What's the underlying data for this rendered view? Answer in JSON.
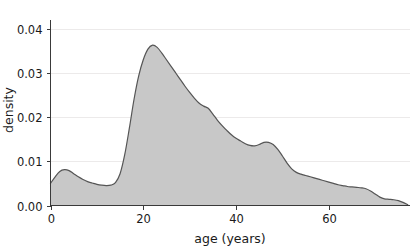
{
  "chart_data": {
    "type": "area",
    "title": "",
    "subtitle": "",
    "xlabel": "age (years)",
    "ylabel": "density",
    "xlim": [
      0,
      77.5
    ],
    "ylim": [
      0,
      0.042
    ],
    "grid": true,
    "legend": "none",
    "legend_entries": [],
    "annotations": [],
    "x_ticks": [
      {
        "value": 0,
        "label": "0"
      },
      {
        "value": 20,
        "label": "20"
      },
      {
        "value": 40,
        "label": "40"
      },
      {
        "value": 60,
        "label": "60"
      }
    ],
    "y_ticks": [
      {
        "value": 0.0,
        "label": "0.00"
      },
      {
        "value": 0.01,
        "label": "0.01"
      },
      {
        "value": 0.02,
        "label": "0.02"
      },
      {
        "value": 0.03,
        "label": "0.03"
      },
      {
        "value": 0.04,
        "label": "0.04"
      }
    ],
    "series": [
      {
        "name": "density",
        "fill_color": "#c8c8c8",
        "line_color": "#555555",
        "x": [
          0,
          1,
          2,
          3,
          4,
          5,
          6,
          7,
          8,
          9,
          10,
          11,
          12,
          13,
          14,
          15,
          16,
          17,
          18,
          19,
          20,
          21,
          22,
          23,
          24,
          25,
          26,
          27,
          28,
          29,
          30,
          31,
          32,
          33,
          34,
          35,
          36,
          37,
          38,
          39,
          40,
          41,
          42,
          43,
          44,
          45,
          46,
          47,
          48,
          49,
          50,
          51,
          52,
          53,
          54,
          55,
          56,
          57,
          58,
          59,
          60,
          61,
          62,
          63,
          64,
          65,
          66,
          67,
          68,
          69,
          70,
          71,
          72,
          73,
          74,
          75,
          76,
          77
        ],
        "y": [
          0.005,
          0.0065,
          0.0077,
          0.0081,
          0.0079,
          0.0072,
          0.0065,
          0.0059,
          0.0054,
          0.0051,
          0.0048,
          0.0046,
          0.0045,
          0.0046,
          0.0052,
          0.0072,
          0.0115,
          0.0175,
          0.024,
          0.0293,
          0.033,
          0.0354,
          0.0363,
          0.0358,
          0.0345,
          0.033,
          0.0315,
          0.03,
          0.0285,
          0.027,
          0.0256,
          0.0243,
          0.0232,
          0.0225,
          0.022,
          0.0207,
          0.0193,
          0.0181,
          0.017,
          0.016,
          0.0152,
          0.0146,
          0.014,
          0.0136,
          0.0135,
          0.0138,
          0.0143,
          0.0143,
          0.0138,
          0.0127,
          0.0112,
          0.0096,
          0.0083,
          0.0075,
          0.0071,
          0.0068,
          0.0065,
          0.0062,
          0.0059,
          0.0056,
          0.0053,
          0.005,
          0.0047,
          0.0045,
          0.0043,
          0.0042,
          0.0041,
          0.004,
          0.0038,
          0.0033,
          0.0026,
          0.0019,
          0.0015,
          0.0014,
          0.0013,
          0.0011,
          0.0007,
          0.0002
        ]
      }
    ],
    "key_points": {
      "start_value": 0.005,
      "early_bump_age": 3,
      "early_bump_value": 0.0081,
      "trough_age": 12,
      "trough_value": 0.0045,
      "peak_age": 22,
      "peak_value": 0.0363,
      "shoulder_age": 46,
      "shoulder_value": 0.0143,
      "end_age": 77,
      "end_value": 0.0002
    }
  }
}
